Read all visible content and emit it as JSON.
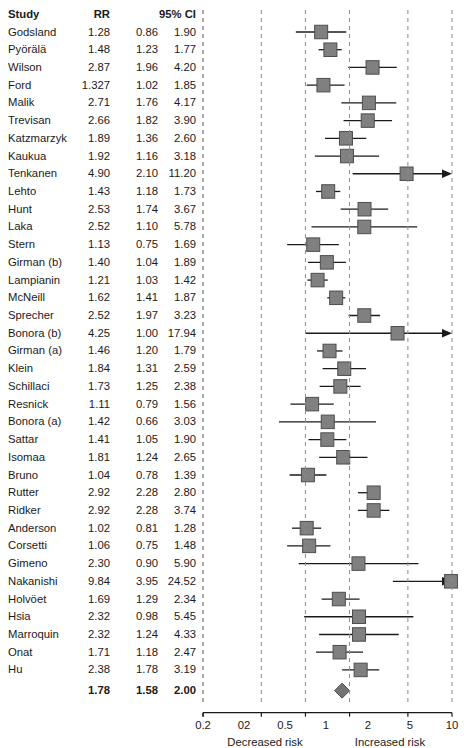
{
  "table": {
    "headers": {
      "study": "Study",
      "rr": "RR",
      "ci": "95% CI"
    },
    "summary_label": "Summary"
  },
  "axis": {
    "ticks": [
      "0.2",
      "02",
      "0.5",
      "1",
      "2",
      "5",
      "10"
    ],
    "tick_values": [
      0.2,
      0.2,
      0.5,
      1,
      2,
      5,
      10
    ],
    "left_label": "Decreased risk",
    "right_label": "Increased risk",
    "min": 0.2,
    "max": 10
  },
  "colors": {
    "box_fill": "#808080",
    "box_edge": "#4d4d4d",
    "line": "#1a1a1a",
    "grid": "#8c8c8c",
    "diamond": "#737373"
  },
  "chart_data": {
    "type": "forest",
    "title": "",
    "xlabel": "Relative risk (log scale)",
    "ylabel": "",
    "xlim": [
      0.2,
      10
    ],
    "xscale": "log",
    "grid": true,
    "effect_measure": "RR",
    "studies": [
      {
        "study": "Godsland",
        "rr": 1.28,
        "ll": 0.86,
        "ul": 1.9
      },
      {
        "study": "Pyörälä",
        "rr": 1.48,
        "ll": 1.23,
        "ul": 1.77
      },
      {
        "study": "Wilson",
        "rr": 2.87,
        "ll": 1.96,
        "ul": 4.2
      },
      {
        "study": "Ford",
        "rr": 1.327,
        "ll": 1.02,
        "ul": 1.85
      },
      {
        "study": "Malik",
        "rr": 2.71,
        "ll": 1.76,
        "ul": 4.17
      },
      {
        "study": "Trevisan",
        "rr": 2.66,
        "ll": 1.82,
        "ul": 3.9
      },
      {
        "study": "Katzmarzyk",
        "rr": 1.89,
        "ll": 1.36,
        "ul": 2.6
      },
      {
        "study": "Kaukua",
        "rr": 1.92,
        "ll": 1.16,
        "ul": 3.18
      },
      {
        "study": "Tenkanen",
        "rr": 4.9,
        "ll": 2.1,
        "ul": 11.2
      },
      {
        "study": "Lehto",
        "rr": 1.43,
        "ll": 1.18,
        "ul": 1.73
      },
      {
        "study": "Hunt",
        "rr": 2.53,
        "ll": 1.74,
        "ul": 3.67
      },
      {
        "study": "Laka",
        "rr": 2.52,
        "ll": 1.1,
        "ul": 5.78
      },
      {
        "study": "Stern",
        "rr": 1.13,
        "ll": 0.75,
        "ul": 1.69
      },
      {
        "study": "Girman (b)",
        "rr": 1.4,
        "ll": 1.04,
        "ul": 1.89
      },
      {
        "study": "Lampianin",
        "rr": 1.21,
        "ll": 1.03,
        "ul": 1.42
      },
      {
        "study": "McNeill",
        "rr": 1.62,
        "ll": 1.41,
        "ul": 1.87
      },
      {
        "study": "Sprecher",
        "rr": 2.52,
        "ll": 1.97,
        "ul": 3.23
      },
      {
        "study": "Bonora (b)",
        "rr": 4.25,
        "ll": 1.0,
        "ul": 17.94
      },
      {
        "study": "Girman (a)",
        "rr": 1.46,
        "ll": 1.2,
        "ul": 1.79
      },
      {
        "study": "Klein",
        "rr": 1.84,
        "ll": 1.31,
        "ul": 2.59
      },
      {
        "study": "Schillaci",
        "rr": 1.73,
        "ll": 1.25,
        "ul": 2.38
      },
      {
        "study": "Resnick",
        "rr": 1.11,
        "ll": 0.79,
        "ul": 1.56
      },
      {
        "study": "Bonora (a)",
        "rr": 1.42,
        "ll": 0.66,
        "ul": 3.03
      },
      {
        "study": "Sattar",
        "rr": 1.41,
        "ll": 1.05,
        "ul": 1.9
      },
      {
        "study": "Isomaa",
        "rr": 1.81,
        "ll": 1.24,
        "ul": 2.65
      },
      {
        "study": "Bruno",
        "rr": 1.04,
        "ll": 0.78,
        "ul": 1.39
      },
      {
        "study": "Rutter",
        "rr": 2.92,
        "ll": 2.28,
        "ul": 2.8
      },
      {
        "study": "Ridker",
        "rr": 2.92,
        "ll": 2.28,
        "ul": 3.74
      },
      {
        "study": "Anderson",
        "rr": 1.02,
        "ll": 0.81,
        "ul": 1.28
      },
      {
        "study": "Corsetti",
        "rr": 1.06,
        "ll": 0.75,
        "ul": 1.48
      },
      {
        "study": "Gimeno",
        "rr": 2.3,
        "ll": 0.9,
        "ul": 5.9
      },
      {
        "study": "Nakanishi",
        "rr": 9.84,
        "ll": 3.95,
        "ul": 24.52
      },
      {
        "study": "Holvöet",
        "rr": 1.69,
        "ll": 1.29,
        "ul": 2.34
      },
      {
        "study": "Hsia",
        "rr": 2.32,
        "ll": 0.98,
        "ul": 5.45
      },
      {
        "study": "Marroquin",
        "rr": 2.32,
        "ll": 1.24,
        "ul": 4.33
      },
      {
        "study": "Onat",
        "rr": 1.71,
        "ll": 1.18,
        "ul": 2.47
      },
      {
        "study": "Hu",
        "rr": 2.38,
        "ll": 1.78,
        "ul": 3.19
      }
    ],
    "summary": {
      "study": "Summary",
      "rr": 1.78,
      "ll": 1.58,
      "ul": 2.0
    }
  }
}
